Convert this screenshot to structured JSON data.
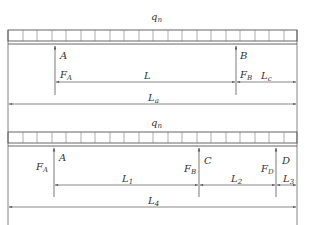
{
  "diagram": {
    "type": "beam-load-diagram",
    "colors": {
      "line": "#555555",
      "text": "#333333",
      "background": "#ffffff"
    },
    "beam1": {
      "load_label": {
        "main": "q",
        "sub": "n"
      },
      "supports": [
        {
          "label": "A",
          "force": {
            "main": "F",
            "sub": "A"
          }
        },
        {
          "label": "B",
          "force": {
            "main": "F",
            "sub": "B"
          }
        }
      ],
      "dimensions": [
        {
          "main": "L",
          "sub": ""
        },
        {
          "main": "L",
          "sub": "c"
        },
        {
          "main": "L",
          "sub": "a"
        }
      ]
    },
    "beam2": {
      "load_label": {
        "main": "q",
        "sub": "n"
      },
      "supports": [
        {
          "label": "A",
          "force": {
            "main": "F",
            "sub": "A"
          }
        },
        {
          "label": "C",
          "force": {
            "main": "F",
            "sub": "B"
          }
        },
        {
          "label": "D",
          "force": {
            "main": "F",
            "sub": "D"
          }
        }
      ],
      "dimensions": [
        {
          "main": "L",
          "sub": "1"
        },
        {
          "main": "L",
          "sub": "2"
        },
        {
          "main": "L",
          "sub": "3"
        },
        {
          "main": "L",
          "sub": "4"
        }
      ]
    }
  }
}
